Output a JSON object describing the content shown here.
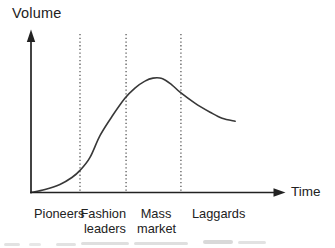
{
  "figure": {
    "y_axis_label": "Volume",
    "x_axis_label": "Time",
    "phase_labels": [
      "Pioneers",
      "Fashion\nleaders",
      "Mass\nmarket",
      "Laggards"
    ]
  },
  "chart_data": {
    "type": "line",
    "title": "",
    "xlabel": "Time",
    "ylabel": "Volume",
    "xlim": [
      0,
      100
    ],
    "ylim": [
      0,
      100
    ],
    "grid": false,
    "x_ticks": [],
    "y_ticks": [],
    "legend": "none",
    "phases": [
      "Pioneers",
      "Fashion leaders",
      "Mass market",
      "Laggards"
    ],
    "phase_boundaries_x": [
      20,
      38.8,
      61.2
    ],
    "series": [
      {
        "name": "volume",
        "x": [
          0,
          5.7,
          11.8,
          16.7,
          20,
          24.1,
          28.2,
          33.1,
          38.4,
          42.4,
          46.5,
          49.8,
          53.5,
          57.6,
          60.8,
          66.9,
          73.1,
          78,
          83.3
        ],
        "y": [
          0,
          1.9,
          5.1,
          9.6,
          14.1,
          22.4,
          36.5,
          48.7,
          60.3,
          66.7,
          71.2,
          73.1,
          72.8,
          68.6,
          64.1,
          57.1,
          51.3,
          47.4,
          45.5
        ]
      }
    ],
    "style": {
      "curve_color": "#383838",
      "axis_color": "#222222",
      "boundary_line_style": "dotted",
      "background": "#ffffff"
    }
  }
}
